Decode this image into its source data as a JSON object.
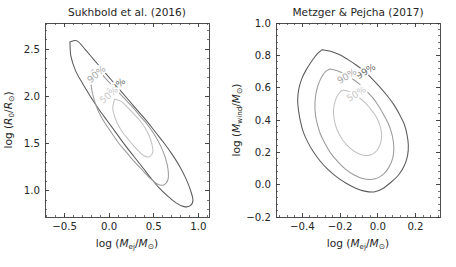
{
  "figure": {
    "width": 456,
    "height": 267,
    "background": "#ffffff",
    "panel_count": 2
  },
  "colors": {
    "contour_99": "#5a5a5a",
    "contour_90": "#9a9a9a",
    "contour_50": "#c2c2c2",
    "axis": "#3b3b3b",
    "text": "#262626"
  },
  "panels": {
    "left": {
      "title": "Sukhbold et al. (2016)",
      "xlabel_prefix": "log (",
      "xlabel_var": "M",
      "xlabel_sub": "ej",
      "xlabel_mid": "/",
      "xlabel_var2": "M",
      "xlabel_sun": "⊙",
      "xlabel_suffix": ")",
      "ylabel_prefix": "log (",
      "ylabel_var": "R",
      "ylabel_sub": "0",
      "ylabel_mid": "/",
      "ylabel_var2": "R",
      "ylabel_sun": "⊙",
      "ylabel_suffix": ")",
      "xticks": [
        "-0.5",
        "0.0",
        "0.5",
        "1.0"
      ],
      "yticks": [
        "1.0",
        "1.5",
        "2.0",
        "2.5"
      ],
      "xlim": [
        -0.72,
        1.12
      ],
      "ylim": [
        0.72,
        2.78
      ],
      "contour_labels": [
        "99%",
        "90%",
        "50%"
      ]
    },
    "right": {
      "title": "Metzger & Pejcha (2017)",
      "xlabel_prefix": "log (",
      "xlabel_var": "M",
      "xlabel_sub": "ej",
      "xlabel_mid": "/",
      "xlabel_var2": "M",
      "xlabel_sun": "⊙",
      "xlabel_suffix": ")",
      "ylabel_prefix": "log (",
      "ylabel_var": "M",
      "ylabel_sub": "wind",
      "ylabel_mid": "/",
      "ylabel_var2": "M",
      "ylabel_sun": "⊙",
      "ylabel_suffix": ")",
      "xticks": [
        "-0.4",
        "-0.2",
        "0.0",
        "0.2"
      ],
      "yticks": [
        "-0.2",
        "0.0",
        "0.2",
        "0.4",
        "0.6",
        "0.8",
        "1.0"
      ],
      "xlim": [
        -0.54,
        0.33
      ],
      "ylim": [
        -0.2,
        1.0
      ],
      "contour_labels": [
        "99%",
        "90%",
        "50%"
      ]
    }
  },
  "chart_data": [
    {
      "type": "line",
      "subtype": "contour",
      "title": "Sukhbold et al. (2016)",
      "xlabel": "log (M_ej/M_sun)",
      "ylabel": "log (R_0/R_sun)",
      "xlim": [
        -0.72,
        1.12
      ],
      "ylim": [
        0.72,
        2.78
      ],
      "xticks": [
        -0.5,
        0.0,
        0.5,
        1.0
      ],
      "yticks": [
        1.0,
        1.5,
        2.0,
        2.5
      ],
      "grid": false,
      "legend": "inline-contour-labels",
      "series": [
        {
          "name": "99%",
          "color": "#5a5a5a",
          "closed": true,
          "points": [
            [
              -0.44,
              2.58
            ],
            [
              -0.36,
              2.59
            ],
            [
              -0.27,
              2.5
            ],
            [
              -0.18,
              2.4
            ],
            [
              -0.08,
              2.29
            ],
            [
              0.02,
              2.18
            ],
            [
              0.12,
              2.07
            ],
            [
              0.22,
              1.96
            ],
            [
              0.32,
              1.85
            ],
            [
              0.42,
              1.74
            ],
            [
              0.52,
              1.62
            ],
            [
              0.62,
              1.5
            ],
            [
              0.71,
              1.38
            ],
            [
              0.79,
              1.26
            ],
            [
              0.86,
              1.13
            ],
            [
              0.91,
              1.01
            ],
            [
              0.94,
              0.9
            ],
            [
              0.91,
              0.84
            ],
            [
              0.84,
              0.83
            ],
            [
              0.75,
              0.87
            ],
            [
              0.66,
              0.94
            ],
            [
              0.56,
              1.03
            ],
            [
              0.47,
              1.13
            ],
            [
              0.38,
              1.24
            ],
            [
              0.28,
              1.36
            ],
            [
              0.18,
              1.48
            ],
            [
              0.08,
              1.61
            ],
            [
              -0.02,
              1.74
            ],
            [
              -0.12,
              1.87
            ],
            [
              -0.21,
              2.0
            ],
            [
              -0.3,
              2.14
            ],
            [
              -0.38,
              2.28
            ],
            [
              -0.43,
              2.43
            ],
            [
              -0.44,
              2.58
            ]
          ]
        },
        {
          "name": "90%",
          "color": "#9a9a9a",
          "closed": true,
          "points": [
            [
              -0.19,
              2.28
            ],
            [
              -0.11,
              2.26
            ],
            [
              -0.02,
              2.17
            ],
            [
              0.07,
              2.08
            ],
            [
              0.16,
              1.99
            ],
            [
              0.25,
              1.9
            ],
            [
              0.34,
              1.8
            ],
            [
              0.43,
              1.7
            ],
            [
              0.51,
              1.59
            ],
            [
              0.58,
              1.47
            ],
            [
              0.63,
              1.35
            ],
            [
              0.66,
              1.23
            ],
            [
              0.66,
              1.12
            ],
            [
              0.61,
              1.06
            ],
            [
              0.54,
              1.07
            ],
            [
              0.46,
              1.13
            ],
            [
              0.38,
              1.21
            ],
            [
              0.29,
              1.3
            ],
            [
              0.2,
              1.4
            ],
            [
              0.11,
              1.5
            ],
            [
              0.03,
              1.61
            ],
            [
              -0.05,
              1.72
            ],
            [
              -0.12,
              1.84
            ],
            [
              -0.17,
              1.97
            ],
            [
              -0.2,
              2.1
            ],
            [
              -0.2,
              2.2
            ],
            [
              -0.19,
              2.28
            ]
          ]
        },
        {
          "name": "50%",
          "color": "#c2c2c2",
          "closed": true,
          "points": [
            [
              0.06,
              1.97
            ],
            [
              0.13,
              1.95
            ],
            [
              0.2,
              1.89
            ],
            [
              0.27,
              1.82
            ],
            [
              0.34,
              1.75
            ],
            [
              0.4,
              1.67
            ],
            [
              0.45,
              1.58
            ],
            [
              0.48,
              1.49
            ],
            [
              0.49,
              1.41
            ],
            [
              0.45,
              1.36
            ],
            [
              0.39,
              1.37
            ],
            [
              0.33,
              1.42
            ],
            [
              0.27,
              1.48
            ],
            [
              0.21,
              1.55
            ],
            [
              0.15,
              1.62
            ],
            [
              0.1,
              1.7
            ],
            [
              0.06,
              1.79
            ],
            [
              0.04,
              1.88
            ],
            [
              0.06,
              1.97
            ]
          ]
        }
      ],
      "annotations": [
        {
          "text": "99%",
          "x": 0.1,
          "y": 2.08,
          "rotation": -40,
          "color": "#6f6f6f"
        },
        {
          "text": "90%",
          "x": -0.12,
          "y": 2.21,
          "rotation": -40,
          "color": "#a8a8a8"
        },
        {
          "text": "50%",
          "x": 0.02,
          "y": 1.99,
          "rotation": -40,
          "color": "#c8c8c8"
        }
      ]
    },
    {
      "type": "line",
      "subtype": "contour",
      "title": "Metzger & Pejcha (2017)",
      "xlabel": "log (M_ej/M_sun)",
      "ylabel": "log (M_wind/M_sun)",
      "xlim": [
        -0.54,
        0.33
      ],
      "ylim": [
        -0.2,
        1.0
      ],
      "xticks": [
        -0.4,
        -0.2,
        0.0,
        0.2
      ],
      "yticks": [
        -0.2,
        0.0,
        0.2,
        0.4,
        0.6,
        0.8,
        1.0
      ],
      "grid": false,
      "legend": "inline-contour-labels",
      "series": [
        {
          "name": "99%",
          "color": "#5a5a5a",
          "closed": true,
          "points": [
            [
              -0.295,
              0.835
            ],
            [
              -0.25,
              0.825
            ],
            [
              -0.205,
              0.805
            ],
            [
              -0.16,
              0.775
            ],
            [
              -0.115,
              0.74
            ],
            [
              -0.07,
              0.7
            ],
            [
              -0.03,
              0.655
            ],
            [
              0.01,
              0.605
            ],
            [
              0.05,
              0.55
            ],
            [
              0.085,
              0.495
            ],
            [
              0.115,
              0.435
            ],
            [
              0.14,
              0.375
            ],
            [
              0.155,
              0.31
            ],
            [
              0.162,
              0.245
            ],
            [
              0.158,
              0.18
            ],
            [
              0.14,
              0.115
            ],
            [
              0.11,
              0.06
            ],
            [
              0.07,
              0.015
            ],
            [
              0.025,
              -0.025
            ],
            [
              -0.02,
              -0.045
            ],
            [
              -0.07,
              -0.04
            ],
            [
              -0.12,
              -0.02
            ],
            [
              -0.17,
              0.01
            ],
            [
              -0.22,
              0.05
            ],
            [
              -0.265,
              0.095
            ],
            [
              -0.305,
              0.145
            ],
            [
              -0.34,
              0.2
            ],
            [
              -0.37,
              0.26
            ],
            [
              -0.395,
              0.325
            ],
            [
              -0.41,
              0.39
            ],
            [
              -0.42,
              0.455
            ],
            [
              -0.425,
              0.52
            ],
            [
              -0.42,
              0.585
            ],
            [
              -0.405,
              0.65
            ],
            [
              -0.38,
              0.71
            ],
            [
              -0.35,
              0.765
            ],
            [
              -0.32,
              0.81
            ],
            [
              -0.295,
              0.835
            ]
          ]
        },
        {
          "name": "90%",
          "color": "#9a9a9a",
          "closed": true,
          "points": [
            [
              -0.255,
              0.715
            ],
            [
              -0.215,
              0.705
            ],
            [
              -0.175,
              0.685
            ],
            [
              -0.135,
              0.655
            ],
            [
              -0.095,
              0.62
            ],
            [
              -0.06,
              0.58
            ],
            [
              -0.025,
              0.535
            ],
            [
              0.005,
              0.485
            ],
            [
              0.03,
              0.435
            ],
            [
              0.055,
              0.38
            ],
            [
              0.072,
              0.325
            ],
            [
              0.082,
              0.27
            ],
            [
              0.085,
              0.215
            ],
            [
              0.078,
              0.16
            ],
            [
              0.06,
              0.11
            ],
            [
              0.035,
              0.07
            ],
            [
              0.0,
              0.042
            ],
            [
              -0.04,
              0.032
            ],
            [
              -0.08,
              0.038
            ],
            [
              -0.125,
              0.06
            ],
            [
              -0.17,
              0.095
            ],
            [
              -0.21,
              0.14
            ],
            [
              -0.25,
              0.195
            ],
            [
              -0.28,
              0.255
            ],
            [
              -0.305,
              0.315
            ],
            [
              -0.322,
              0.38
            ],
            [
              -0.332,
              0.445
            ],
            [
              -0.333,
              0.51
            ],
            [
              -0.327,
              0.57
            ],
            [
              -0.313,
              0.628
            ],
            [
              -0.293,
              0.675
            ],
            [
              -0.275,
              0.702
            ],
            [
              -0.255,
              0.715
            ]
          ]
        },
        {
          "name": "50%",
          "color": "#c2c2c2",
          "closed": true,
          "points": [
            [
              -0.185,
              0.585
            ],
            [
              -0.155,
              0.578
            ],
            [
              -0.125,
              0.56
            ],
            [
              -0.095,
              0.535
            ],
            [
              -0.065,
              0.505
            ],
            [
              -0.04,
              0.47
            ],
            [
              -0.015,
              0.432
            ],
            [
              0.003,
              0.392
            ],
            [
              0.015,
              0.35
            ],
            [
              0.02,
              0.308
            ],
            [
              0.017,
              0.268
            ],
            [
              0.006,
              0.232
            ],
            [
              -0.012,
              0.203
            ],
            [
              -0.036,
              0.185
            ],
            [
              -0.064,
              0.18
            ],
            [
              -0.095,
              0.188
            ],
            [
              -0.128,
              0.208
            ],
            [
              -0.158,
              0.238
            ],
            [
              -0.185,
              0.275
            ],
            [
              -0.207,
              0.318
            ],
            [
              -0.223,
              0.363
            ],
            [
              -0.232,
              0.41
            ],
            [
              -0.235,
              0.455
            ],
            [
              -0.23,
              0.5
            ],
            [
              -0.218,
              0.542
            ],
            [
              -0.202,
              0.57
            ],
            [
              -0.185,
              0.585
            ]
          ]
        }
      ],
      "annotations": [
        {
          "text": "99%",
          "x": -0.055,
          "y": 0.685,
          "rotation": -32,
          "color": "#6f6f6f"
        },
        {
          "text": "90%",
          "x": -0.155,
          "y": 0.655,
          "rotation": -32,
          "color": "#a8a8a8"
        },
        {
          "text": "50%",
          "x": -0.105,
          "y": 0.545,
          "rotation": -32,
          "color": "#c8c8c8"
        }
      ]
    }
  ]
}
